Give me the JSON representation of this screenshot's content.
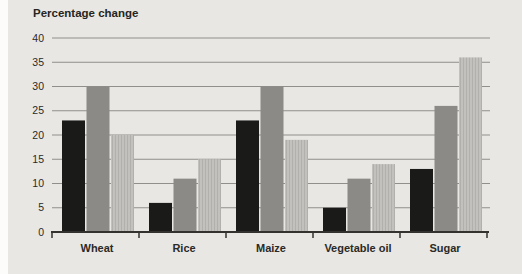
{
  "panel": {
    "background": "#e8e7e3"
  },
  "chart_data": {
    "type": "bar",
    "title": "Percentage change",
    "categories": [
      "Wheat",
      "Rice",
      "Maize",
      "Vegetable oil",
      "Sugar"
    ],
    "series": [
      {
        "name": "black",
        "color": "#1a1a19",
        "values": [
          23,
          6,
          23,
          5,
          13
        ]
      },
      {
        "name": "dark-gray",
        "color": "#8b8a87",
        "values": [
          30,
          11,
          30,
          11,
          26
        ]
      },
      {
        "name": "light-gray",
        "color": "#c2c1bd",
        "stripe_color": "#b1b0ac",
        "values": [
          20,
          15,
          19,
          14,
          36
        ]
      }
    ],
    "ylim": [
      0,
      40
    ],
    "yticks": [
      0,
      5,
      10,
      15,
      20,
      25,
      30,
      35,
      40
    ],
    "xlabel": "",
    "ylabel": "",
    "grid": true,
    "legend_position": "none",
    "axis_color": "#33322f",
    "grid_color": "#908f8c",
    "text_color": "#2b2a27"
  }
}
